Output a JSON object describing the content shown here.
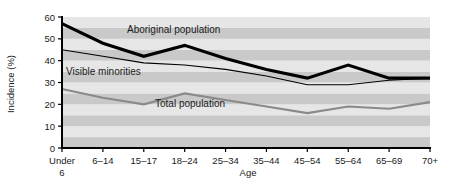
{
  "chart_data": {
    "type": "line",
    "title": "",
    "xlabel": "Age",
    "ylabel": "Incidence (%)",
    "categories": [
      "Under 6",
      "6–14",
      "15–17",
      "18–24",
      "25–34",
      "35–44",
      "45–54",
      "55–64",
      "65–69",
      "70+"
    ],
    "category_labels_line1": [
      "Under",
      "6–14",
      "15–17",
      "18–24",
      "25–34",
      "35–44",
      "45–54",
      "55–64",
      "65–69",
      "70+"
    ],
    "category_labels_line2": [
      "6",
      "",
      "",
      "",
      "",
      "",
      "",
      "",
      "",
      ""
    ],
    "ylim": [
      0,
      60
    ],
    "yticks": [
      0,
      10,
      20,
      30,
      40,
      50,
      60
    ],
    "ytick_labels": [
      "0",
      "10",
      "20",
      "30",
      "40",
      "50",
      "60"
    ],
    "grid": "horizontal-banded",
    "legend": "inline-annotations",
    "series": [
      {
        "name": "Aboriginal population",
        "label": "Aboriginal population",
        "color": "#000000",
        "width": 3.1,
        "values": [
          57,
          48,
          42,
          47,
          41,
          36,
          32,
          38,
          32,
          32
        ]
      },
      {
        "name": "Visible minorities",
        "label": "Visible minorities",
        "color": "#000000",
        "width": 1.1,
        "values": [
          45,
          42,
          39,
          38,
          36,
          33,
          29,
          29,
          31,
          32
        ]
      },
      {
        "name": "Total population",
        "label": "Total population",
        "color": "#8a8a8a",
        "width": 2.1,
        "values": [
          27,
          23,
          20,
          25,
          22,
          19,
          16,
          19,
          18,
          21
        ]
      }
    ],
    "annotations": [
      {
        "text": "Aboriginal population",
        "x": 127,
        "y": 33
      },
      {
        "text": "Visible minorities",
        "x": 66,
        "y": 75
      },
      {
        "text": "Total population",
        "x": 155,
        "y": 107
      }
    ],
    "colors": {
      "band_light": "#e6e6e6",
      "band_dark": "#c9c9c9",
      "axis": "#000000",
      "background": "#ffffff"
    }
  }
}
